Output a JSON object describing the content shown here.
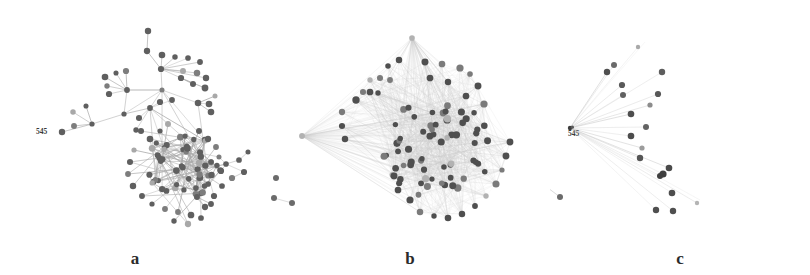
{
  "figure": {
    "background_color": "#ffffff",
    "width": 810,
    "height": 275,
    "node_color_dark": "#5f5f5f",
    "node_color_mid": "#7d7d7d",
    "node_color_light": "#a8a8a8",
    "edge_color": "#9a9a9a"
  },
  "panels": [
    {
      "id": "a",
      "caption": "a",
      "hub_label": "545",
      "layout": "sparse tree-like network with hub-and-spoke branches and one dense core",
      "node_count": 118,
      "edge_count": 150
    },
    {
      "id": "b",
      "caption": "b",
      "hub_label": "545",
      "layout": "dense hairball network, triangular fan silhouette, heavy edge overlap",
      "node_count": 92,
      "edge_count": 900
    },
    {
      "id": "c",
      "caption": "c",
      "hub_label": "545",
      "layout": "star / fan: single left hub radiating faint edges to scattered peripheral nodes",
      "node_count": 20,
      "edge_count": 20
    }
  ],
  "chart_data": {
    "type": "scatter",
    "title": "",
    "subtitle": "",
    "xlabel": "",
    "ylabel": "",
    "legend": [],
    "annotations": [
      "545",
      "545",
      "545",
      "a",
      "b",
      "c"
    ],
    "panel_captions": [
      "a",
      "b",
      "c"
    ],
    "node_labels": [
      "545"
    ],
    "series": [
      {
        "name": "panel-a-nodes",
        "values": [
          118
        ]
      },
      {
        "name": "panel-a-edges",
        "values": [
          150
        ]
      },
      {
        "name": "panel-b-nodes",
        "values": [
          92
        ]
      },
      {
        "name": "panel-b-edges",
        "values": [
          900
        ]
      },
      {
        "name": "panel-c-nodes",
        "values": [
          20
        ]
      },
      {
        "name": "panel-c-edges",
        "values": [
          20
        ]
      }
    ]
  }
}
